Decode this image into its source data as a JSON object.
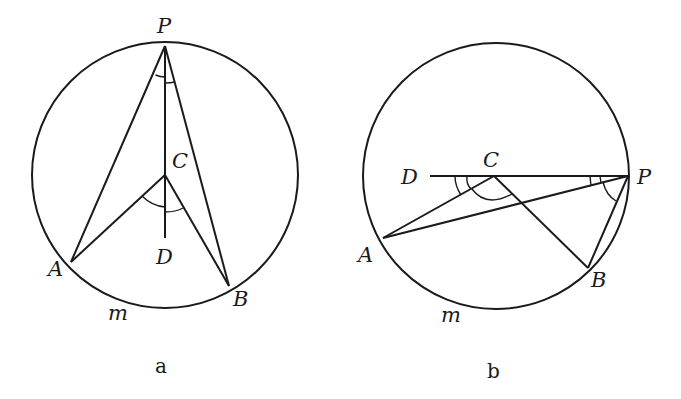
{
  "figures": [
    {
      "id": "a",
      "caption": "a",
      "circle": {
        "cx": 165,
        "cy": 175,
        "r": 133
      },
      "points": {
        "P": {
          "label": "P",
          "x": 165,
          "y": 46
        },
        "C": {
          "label": "C",
          "x": 165,
          "y": 175
        },
        "D": {
          "label": "D",
          "x": 165,
          "y": 238
        },
        "A": {
          "label": "A",
          "x": 71,
          "y": 262
        },
        "B": {
          "label": "B",
          "x": 229,
          "y": 286
        }
      },
      "arc_label": "m",
      "segments": [
        "PA",
        "PB",
        "PD",
        "CA",
        "CB"
      ],
      "angle_marks": [
        "APC",
        "CPB",
        "ACD",
        "DCB"
      ]
    },
    {
      "id": "b",
      "caption": "b",
      "circle": {
        "cx": 496,
        "cy": 176,
        "r": 133
      },
      "points": {
        "P": {
          "label": "P",
          "x": 628,
          "y": 176
        },
        "C": {
          "label": "C",
          "x": 494,
          "y": 176
        },
        "D": {
          "label": "D",
          "x": 430,
          "y": 176
        },
        "A": {
          "label": "A",
          "x": 383,
          "y": 238
        },
        "B": {
          "label": "B",
          "x": 588,
          "y": 268
        }
      },
      "arc_label": "m",
      "segments": [
        "DP",
        "PA",
        "PB",
        "CA",
        "CB"
      ],
      "angle_marks": [
        "DCA",
        "ACB",
        "CPA",
        "APB"
      ]
    }
  ]
}
